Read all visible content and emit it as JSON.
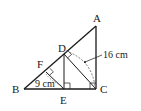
{
  "diagram": {
    "type": "geometry",
    "points": {
      "A": {
        "label": "A",
        "x": 96,
        "y": 26
      },
      "B": {
        "label": "B",
        "x": 24,
        "y": 89
      },
      "C": {
        "label": "C",
        "x": 96,
        "y": 89
      },
      "D": {
        "label": "D",
        "x": 64,
        "y": 54
      },
      "E": {
        "label": "E",
        "x": 64,
        "y": 89
      },
      "F": {
        "label": "F",
        "x": 46,
        "y": 72
      }
    },
    "segments": [
      "AB",
      "AC",
      "BC",
      "CD",
      "DE",
      "EF"
    ],
    "right_angles": [
      "C",
      "E",
      "D",
      "F"
    ],
    "measurements": [
      {
        "label": "16 cm",
        "refers_to": "DC"
      },
      {
        "label": "9 cm",
        "refers_to": "EF"
      }
    ],
    "colors": {
      "line": "#1a1a1a",
      "dashed": "#555555"
    }
  }
}
